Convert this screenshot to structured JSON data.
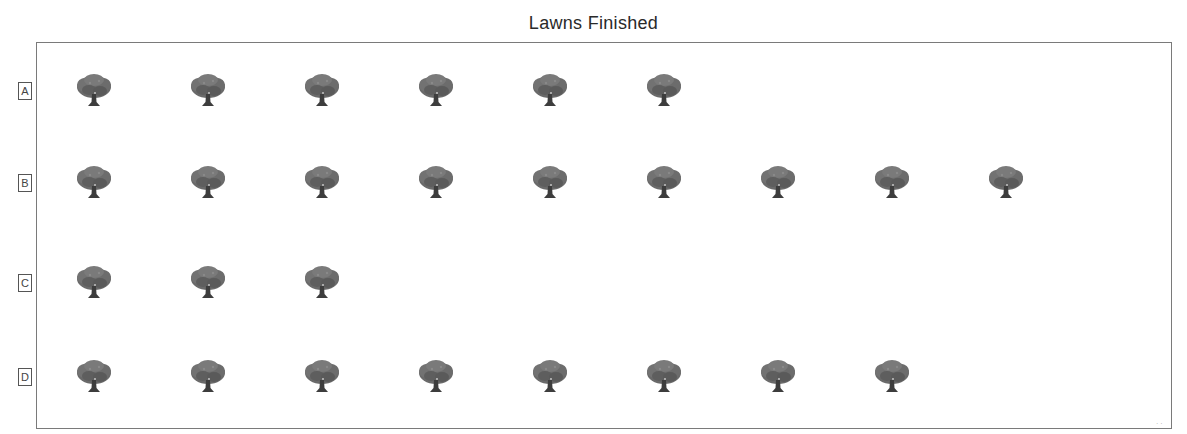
{
  "chart_data": {
    "type": "pictograph",
    "title": "Lawns Finished",
    "icon": "tree-icon",
    "categories": [
      "A",
      "B",
      "C",
      "D"
    ],
    "values": [
      6,
      9,
      3,
      8
    ],
    "xlabel": "",
    "ylabel": "",
    "legend": null,
    "grid": false
  },
  "title": "Lawns Finished",
  "rows": [
    {
      "label": "A",
      "count": 6
    },
    {
      "label": "B",
      "count": 9
    },
    {
      "label": "C",
      "count": 3
    },
    {
      "label": "D",
      "count": 8
    }
  ],
  "colors": {
    "tree_canopy": "#6e6e6e",
    "tree_trunk": "#3f3f3f",
    "frame": "#7a7a7a"
  }
}
